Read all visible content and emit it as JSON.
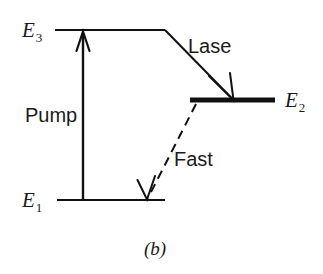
{
  "figure": {
    "caption": "(b)",
    "background_color": "#ffffff",
    "ink_color": "#111111",
    "levels": [
      {
        "id": "E3",
        "label_base": "E",
        "label_sub": "3",
        "label_x": 22,
        "label_y": 37,
        "line_x1": 55,
        "line_x2": 165,
        "line_y": 30,
        "line_width": 2,
        "emphasis": "normal"
      },
      {
        "id": "E2",
        "label_base": "E",
        "label_sub": "2",
        "label_x": 285,
        "label_y": 107,
        "line_x1": 190,
        "line_x2": 275,
        "line_y": 100,
        "line_width": 5,
        "emphasis": "bold"
      },
      {
        "id": "E1",
        "label_base": "E",
        "label_sub": "1",
        "label_x": 22,
        "label_y": 207,
        "line_x1": 57,
        "line_x2": 165,
        "line_y": 200,
        "line_width": 2,
        "emphasis": "normal"
      }
    ],
    "transitions": [
      {
        "id": "pump",
        "label": "Pump",
        "label_x": 25,
        "label_y": 122,
        "style": "solid",
        "from_level": "E1",
        "to_level": "E3",
        "x1": 83,
        "y1": 200,
        "x2": 83,
        "y2": 32,
        "stroke_width": 2.4,
        "arrow_at": "end",
        "arrow_direction": "up"
      },
      {
        "id": "lase",
        "label": "Lase",
        "label_x": 188,
        "label_y": 53,
        "style": "solid",
        "from_level": "E3",
        "to_level": "E2",
        "x1": 165,
        "y1": 30,
        "x2": 233,
        "y2": 99,
        "stroke_width": 2.0,
        "arrow_at": "end",
        "arrow_direction": "down-right"
      },
      {
        "id": "fast",
        "label": "Fast",
        "label_x": 174,
        "label_y": 166,
        "style": "dashed",
        "from_level": "E2",
        "to_level": "E1",
        "x1": 196,
        "y1": 104,
        "x2": 147,
        "y2": 199,
        "stroke_width": 2.0,
        "dash_pattern": "9 6",
        "arrow_at": "end",
        "arrow_direction": "down-left"
      }
    ]
  }
}
